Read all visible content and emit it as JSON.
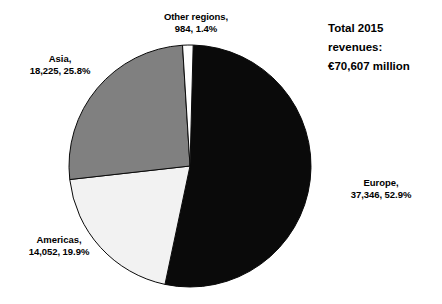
{
  "chart_data": {
    "type": "pie",
    "title": "",
    "subtitle": "",
    "xlabel": "",
    "ylabel": "",
    "legend_position": "none",
    "grid": false,
    "total_value": 70607,
    "total_unit": "million",
    "currency_symbol": "€",
    "categories": [
      "Europe",
      "Asia",
      "Americas",
      "Other regions"
    ],
    "values": [
      37346,
      18225,
      14052,
      984
    ],
    "percentages": [
      52.9,
      25.8,
      19.9,
      1.4
    ],
    "colors": [
      "#0a0a0a",
      "#808080",
      "#f2f2f2",
      "#ffffff"
    ],
    "slices": [
      {
        "name": "Europe",
        "value": 37346,
        "value_text": "37,346",
        "percent": 52.9,
        "percent_text": "52.9%",
        "color": "#0a0a0a",
        "label_line1": "Europe,",
        "label_line2": "37,346, 52.9%"
      },
      {
        "name": "Americas",
        "value": 14052,
        "value_text": "14,052",
        "percent": 19.9,
        "percent_text": "19.9%",
        "color": "#f2f2f2",
        "label_line1": "Americas,",
        "label_line2": "14,052, 19.9%"
      },
      {
        "name": "Asia",
        "value": 18225,
        "value_text": "18,225",
        "percent": 25.8,
        "percent_text": "25.8%",
        "color": "#808080",
        "label_line1": "Asia,",
        "label_line2": "18,225, 25.8%"
      },
      {
        "name": "Other regions",
        "value": 984,
        "value_text": "984",
        "percent": 1.4,
        "percent_text": "1.4%",
        "color": "#ffffff",
        "label_line1": "Other regions,",
        "label_line2": "984, 1.4%"
      }
    ],
    "annotation": {
      "line1": "Total 2015",
      "line2": "revenues:",
      "line3": "€70,607 million"
    },
    "geometry": {
      "center_x": 190,
      "center_y": 166,
      "radius": 121,
      "start_angle_deg": 1.5,
      "direction": "clockwise"
    }
  }
}
